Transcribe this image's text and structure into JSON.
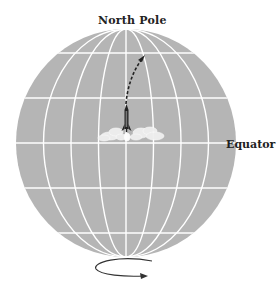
{
  "labels": {
    "north_pole": "North Pole",
    "equator": "Equator"
  },
  "colors": {
    "globe": "#b5b5b5",
    "grid": "#ffffff",
    "ink": "#222222",
    "smoke": "#eeeeee"
  },
  "globe": {
    "meridian_count": 7,
    "parallel_count": 5
  },
  "elements": {
    "rocket": "rocket-icon",
    "trajectory": "dashed-trajectory-arrow",
    "rotation": "rotation-arrow"
  }
}
